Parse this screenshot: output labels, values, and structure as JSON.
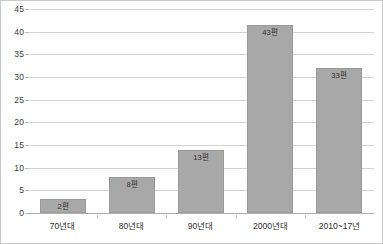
{
  "chart_data": {
    "type": "bar",
    "title": "",
    "subtitle": "",
    "xlabel": "",
    "ylabel": "",
    "categories": [
      "70년대",
      "80년대",
      "90년대",
      "2000년대",
      "2010~17년"
    ],
    "values": [
      2,
      8,
      13,
      43,
      33
    ],
    "bar_pixel_values": [
      3,
      8,
      14,
      41.5,
      32
    ],
    "data_labels": [
      "2편",
      "8편",
      "13편",
      "43편",
      "33편"
    ],
    "ylim": [
      0,
      45
    ],
    "ytick_step": 5,
    "ytick_labels": [
      "0",
      "5",
      "10",
      "15",
      "20",
      "25",
      "30",
      "35",
      "40",
      "45"
    ],
    "ytick_values": [
      0,
      5,
      10,
      15,
      20,
      25,
      30,
      35,
      40,
      45
    ],
    "grid": true,
    "grid_axis": "y",
    "legend": false,
    "legend_position": "none",
    "series": [
      {
        "name": "",
        "values": [
          2,
          8,
          13,
          43,
          33
        ]
      }
    ],
    "colors": {
      "bar_fill": "#a8a8a8",
      "bar_stroke": "#9a9a9a",
      "gridline": "#d2d2d2",
      "baseline": "#b0b0b0",
      "frame": "#c9c9c9",
      "text": "#2e2e2e",
      "tick_text": "#3a3a3a",
      "background": "#ffffff"
    }
  }
}
